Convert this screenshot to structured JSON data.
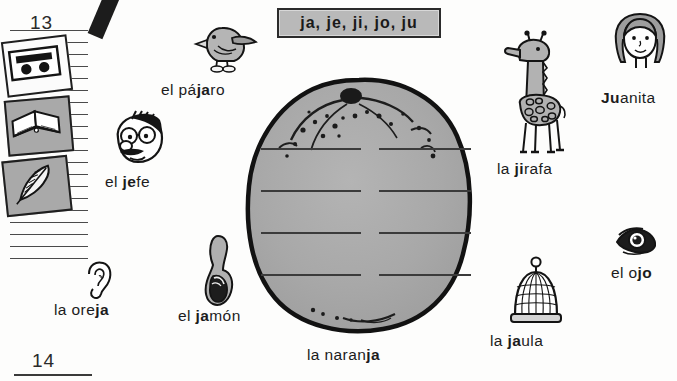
{
  "page": {
    "top_page_number": "13",
    "bottom_page_number": "14"
  },
  "header": {
    "syllables": "ja, je, ji, jo, ju"
  },
  "sidebar": {
    "cards": [
      {
        "icon": "cassette-tape-icon",
        "shaded": false
      },
      {
        "icon": "open-book-icon",
        "shaded": true
      },
      {
        "icon": "feather-quill-icon",
        "shaded": true
      }
    ]
  },
  "items": [
    {
      "key": "pajaro",
      "icon": "bird-icon",
      "prefix": "el pá",
      "bold": "ja",
      "suffix": "ro",
      "full": "el pájaro"
    },
    {
      "key": "jefe",
      "icon": "boss-face-icon",
      "prefix": "el ",
      "bold": "je",
      "suffix": "fe",
      "full": "el jefe"
    },
    {
      "key": "oreja",
      "icon": "ear-icon",
      "prefix": "la ore",
      "bold": "ja",
      "suffix": "",
      "full": "la oreja"
    },
    {
      "key": "jamon",
      "icon": "ham-icon",
      "prefix": "el ",
      "bold": "ja",
      "suffix": "món",
      "full": "el jamón"
    },
    {
      "key": "naranja",
      "icon": "orange-fruit-icon",
      "prefix": "la naran",
      "bold": "ja",
      "suffix": "",
      "full": "la naranja"
    },
    {
      "key": "jaula",
      "icon": "birdcage-icon",
      "prefix": "la ",
      "bold": "ja",
      "suffix": "ula",
      "full": "la jaula"
    },
    {
      "key": "jirafa",
      "icon": "giraffe-icon",
      "prefix": "la ",
      "bold": "ji",
      "suffix": "rafa",
      "full": "la jirafa"
    },
    {
      "key": "juanita",
      "icon": "girl-face-icon",
      "prefix": "",
      "bold": "Ju",
      "suffix": "anita",
      "full": "Juanita"
    },
    {
      "key": "ojo",
      "icon": "eye-icon",
      "prefix": "el o",
      "bold": "jo",
      "suffix": "",
      "full": "el ojo"
    }
  ],
  "writing_area": {
    "rows": 4,
    "columns": 2,
    "line_count": 8
  },
  "colors": {
    "orange_fill": "#a8a8a8",
    "orange_outline": "#121212",
    "syllable_box_fill": "#b9b9b9",
    "ink": "#1c1c1c",
    "paper": "#fdfdfc"
  }
}
